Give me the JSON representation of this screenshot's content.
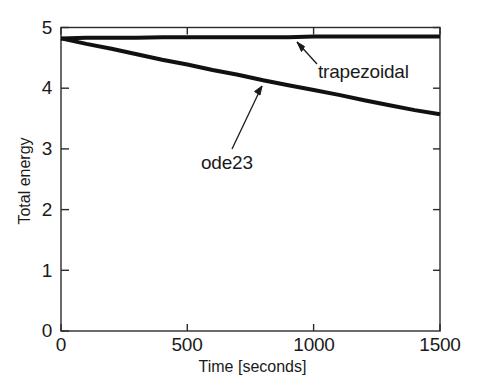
{
  "chart_data": {
    "type": "line",
    "title": "",
    "xlabel": "Time [seconds]",
    "ylabel": "Total energy",
    "xlim": [
      0,
      1500
    ],
    "ylim": [
      0,
      5
    ],
    "xticks": [
      0,
      500,
      1000,
      1500
    ],
    "xtick_labels": [
      "0",
      "500",
      "1000",
      "1500"
    ],
    "yticks": [
      0,
      1,
      2,
      3,
      4,
      5
    ],
    "ytick_labels": [
      "0",
      "1",
      "2",
      "3",
      "4",
      "5"
    ],
    "grid": false,
    "legend": "none",
    "line_color": "#111111",
    "axis_color": "#2b2b2b",
    "background": "#ffffff",
    "series": [
      {
        "name": "trapezoidal",
        "x": [
          0,
          100,
          200,
          300,
          400,
          500,
          600,
          700,
          800,
          900,
          1000,
          1100,
          1200,
          1300,
          1400,
          1500
        ],
        "values": [
          4.82,
          4.83,
          4.83,
          4.83,
          4.84,
          4.84,
          4.84,
          4.84,
          4.84,
          4.84,
          4.85,
          4.85,
          4.85,
          4.85,
          4.85,
          4.85
        ]
      },
      {
        "name": "ode23",
        "x": [
          0,
          100,
          200,
          300,
          400,
          500,
          600,
          700,
          800,
          900,
          1000,
          1100,
          1200,
          1300,
          1400,
          1500
        ],
        "values": [
          4.82,
          4.73,
          4.65,
          4.56,
          4.47,
          4.39,
          4.3,
          4.22,
          4.13,
          4.05,
          3.97,
          3.89,
          3.8,
          3.72,
          3.64,
          3.57
        ]
      }
    ],
    "annotations": [
      {
        "text": "trapezoidal",
        "text_x": 1020,
        "text_y": 4.04,
        "point_x": 925,
        "point_y": 4.8
      },
      {
        "text": "ode23",
        "text_x": 560,
        "text_y": 2.73,
        "point_x": 795,
        "point_y": 4.08
      }
    ]
  }
}
